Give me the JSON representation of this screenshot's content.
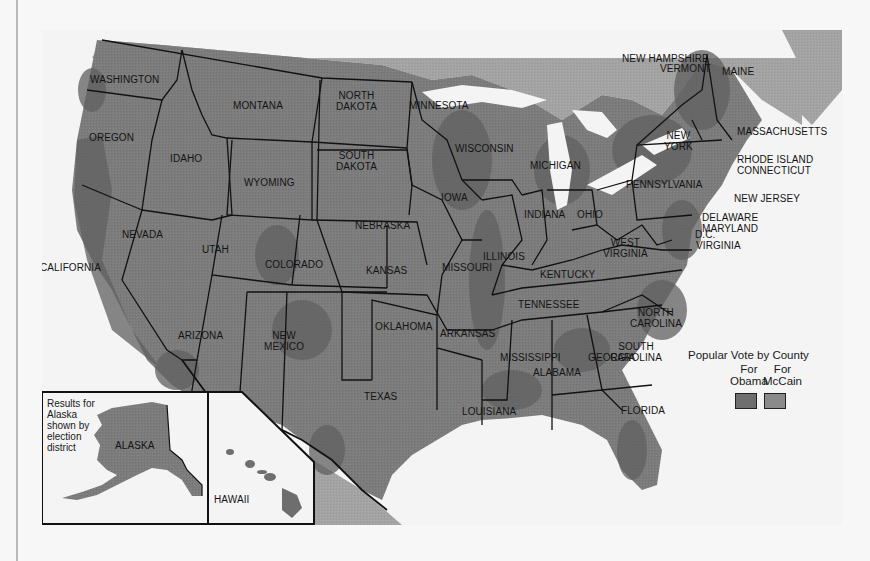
{
  "map": {
    "title": "Popular Vote by County",
    "subject": "United States presidential election popular vote by county",
    "colors": {
      "page_background": "#f7f7f7",
      "water": "#f4f4f4",
      "foreign_land": "#9c9c9c",
      "obama_county": "#6e6e6e",
      "mccain_county": "#8a8a8a",
      "state_border": "#111111",
      "left_rule": "#b9b9b9"
    },
    "states": [
      {
        "name": "WASHINGTON"
      },
      {
        "name": "OREGON"
      },
      {
        "name": "IDAHO"
      },
      {
        "name": "MONTANA"
      },
      {
        "name": "WYOMING"
      },
      {
        "name": "NORTH",
        "name2": "DAKOTA"
      },
      {
        "name": "SOUTH",
        "name2": "DAKOTA"
      },
      {
        "name": "MINNESOTA"
      },
      {
        "name": "WISCONSIN"
      },
      {
        "name": "MICHIGAN"
      },
      {
        "name": "IOWA"
      },
      {
        "name": "NEBRASKA"
      },
      {
        "name": "NEVADA"
      },
      {
        "name": "UTAH"
      },
      {
        "name": "COLORADO"
      },
      {
        "name": "CALIFORNIA"
      },
      {
        "name": "KANSAS"
      },
      {
        "name": "MISSOURI"
      },
      {
        "name": "ILLINOIS"
      },
      {
        "name": "INDIANA"
      },
      {
        "name": "OHIO"
      },
      {
        "name": "PENNSYLVANIA"
      },
      {
        "name": "NEW",
        "name2": "YORK"
      },
      {
        "name": "MAINE"
      },
      {
        "name": "NEW HAMPSHIRE"
      },
      {
        "name": "VERMONT"
      },
      {
        "name": "MASSACHUSETTS"
      },
      {
        "name": "RHODE ISLAND"
      },
      {
        "name": "CONNECTICUT"
      },
      {
        "name": "NEW JERSEY"
      },
      {
        "name": "DELAWARE"
      },
      {
        "name": "MARYLAND"
      },
      {
        "name": "D.C."
      },
      {
        "name": "VIRGINIA"
      },
      {
        "name": "WEST",
        "name2": "VIRGINIA"
      },
      {
        "name": "KENTUCKY"
      },
      {
        "name": "TENNESSEE"
      },
      {
        "name": "NORTH",
        "name2": "CAROLINA"
      },
      {
        "name": "SOUTH",
        "name2": "CAROLINA"
      },
      {
        "name": "GEORGIA"
      },
      {
        "name": "ALABAMA"
      },
      {
        "name": "MISSISSIPPI"
      },
      {
        "name": "ARKANSAS"
      },
      {
        "name": "OKLAHOMA"
      },
      {
        "name": "LOUISIANA"
      },
      {
        "name": "TEXAS"
      },
      {
        "name": "NEW",
        "name2": "MEXICO"
      },
      {
        "name": "ARIZONA"
      },
      {
        "name": "FLORIDA"
      }
    ],
    "insets": {
      "alaska": {
        "label": "ALASKA",
        "note": [
          "Results for",
          "Alaska",
          "shown by",
          "election",
          "district"
        ]
      },
      "hawaii": {
        "label": "HAWAII"
      }
    },
    "legend": {
      "title": "Popular Vote by County",
      "items": [
        {
          "line1": "For",
          "line2": "Obama",
          "color": "#6e6e6e"
        },
        {
          "line1": "For",
          "line2": "McCain",
          "color": "#8a8a8a"
        }
      ]
    }
  }
}
